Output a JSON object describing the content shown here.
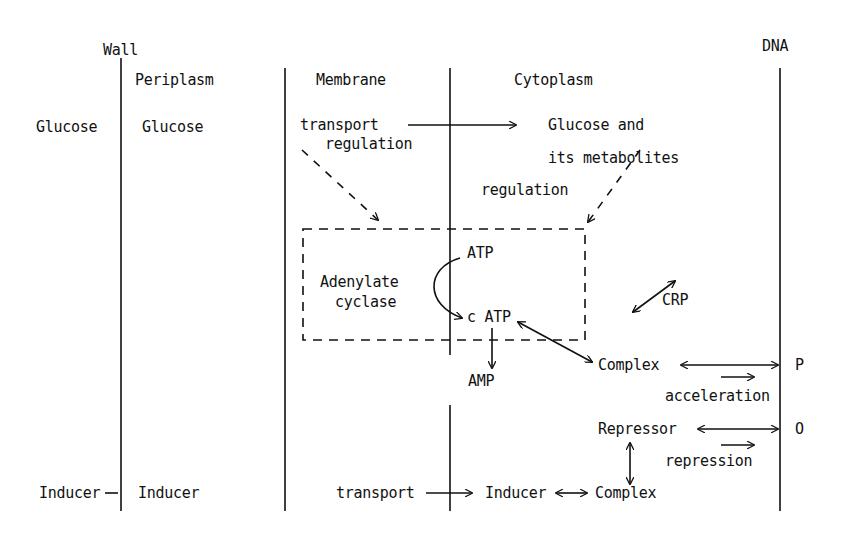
{
  "regions": {
    "wall": "Wall",
    "periplasm": "Periplasm",
    "membrane": "Membrane",
    "cytoplasm": "Cytoplasm",
    "dna": "DNA"
  },
  "glucose_row": {
    "outside": "Glucose",
    "periplasm": "Glucose",
    "transport_line1": "transport",
    "transport_line2": "regulation",
    "metabolites_line1": "Glucose and",
    "metabolites_line2": "its metabolites",
    "regulation": "regulation"
  },
  "enzyme_box": {
    "label_line1": "Adenylate",
    "label_line2": "cyclase",
    "atp": "ATP",
    "camp": "c ATP",
    "amp": "AMP"
  },
  "crp_pathway": {
    "crp": "CRP",
    "complex": "Complex",
    "promoter": "P",
    "acceleration": "acceleration"
  },
  "repressor_pathway": {
    "repressor": "Repressor",
    "operator": "O",
    "repression": "repression"
  },
  "inducer_row": {
    "outside": "Inducer",
    "periplasm": "Inducer",
    "transport": "transport",
    "inducer": "Inducer",
    "complex": "Complex"
  },
  "colors": {
    "ink": "#111111",
    "background": "#ffffff"
  }
}
